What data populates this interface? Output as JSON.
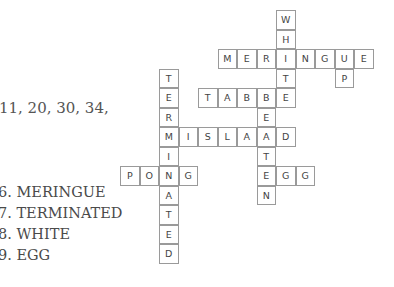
{
  "partial_text": "11, 20, 30, 34,",
  "answers": [
    {
      "number": "6",
      "word": "MERINGUE"
    },
    {
      "number": "7",
      "word": "TERMINATED"
    },
    {
      "number": "8",
      "word": "WHITE"
    },
    {
      "number": "9",
      "word": "EGG"
    }
  ],
  "crossword": {
    "grid_origin": {
      "x": 120,
      "y": 10
    },
    "cell_size": 19.5,
    "words": [
      {
        "word": "PONG",
        "direction": "across",
        "row": 8,
        "col": 0
      },
      {
        "word": "TERMINATED",
        "direction": "down",
        "row": 3,
        "col": 2
      },
      {
        "word": "MISLAID",
        "direction": "across",
        "row": 6,
        "col": 2
      },
      {
        "word": "TABLE",
        "direction": "across",
        "row": 4,
        "col": 4
      },
      {
        "word": "WHITE",
        "direction": "down",
        "row": 0,
        "col": 8
      },
      {
        "word": "MERINGUE",
        "direction": "across",
        "row": 2,
        "col": 5
      },
      {
        "word": "UP",
        "direction": "down",
        "row": 2,
        "col": 11
      },
      {
        "word": "BEATEN",
        "direction": "down",
        "row": 4,
        "col": 7
      },
      {
        "word": "EGG",
        "direction": "across",
        "row": 8,
        "col": 7
      }
    ]
  },
  "colors": {
    "cell_border": "#9a9a9a",
    "letter": "#444444",
    "text": "#4a4a4a"
  }
}
